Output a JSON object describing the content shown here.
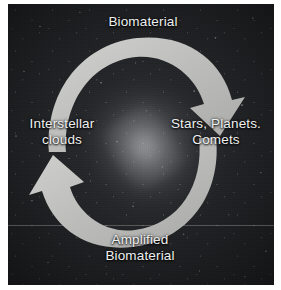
{
  "figure": {
    "type": "cycle-diagram",
    "background": "starfield-galaxy-photograph",
    "arrow_color": "#bcbcbc",
    "text_color": "#eef0f0",
    "plate_color": "#232427"
  },
  "labels": {
    "top": "Biomaterial",
    "right": "Stars, Planets.\nComets",
    "left": "Interstellar\nclouds",
    "bottom": "Amplified\nBiomaterial"
  },
  "arrows": [
    {
      "id": "top-arrow",
      "name": "clockwise-arrow-biomaterial-to-stars",
      "from": "Biomaterial",
      "to": "Stars, Planets. Comets",
      "direction": "clockwise",
      "head": "down-right"
    },
    {
      "id": "bottom-arrow",
      "name": "clockwise-arrow-amplified-biomaterial-to-interstellar-clouds",
      "from": "Amplified Biomaterial",
      "to": "Interstellar clouds",
      "direction": "clockwise",
      "head": "up-left"
    }
  ]
}
